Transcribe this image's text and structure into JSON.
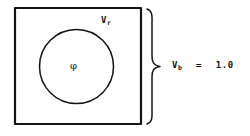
{
  "figure": {
    "background_color": "#ffffff",
    "ink_color": "#141414",
    "shapes": {
      "outer_square": {
        "name": "bulk-volume-square",
        "x": 15,
        "y": 8,
        "width": 126,
        "height": 116,
        "stroke_width": 2.2
      },
      "inner_circle": {
        "name": "reinforcement-volume-circle",
        "cx": 76.5,
        "cy": 66.5,
        "r": 37,
        "stroke_width": 1.5
      },
      "brace": {
        "name": "right-curly-brace",
        "top_y": 8,
        "bottom_y": 124,
        "tip_x": 160,
        "spine_x": 150,
        "stroke_width": 1.5
      }
    },
    "labels": {
      "reinforcement_volume": {
        "base": "V",
        "subscript": "r",
        "full": "Vr"
      },
      "phi": {
        "symbol": "φ"
      },
      "bulk_volume": {
        "base": "V",
        "subscript": "b",
        "equals": "=",
        "value": "1.0",
        "full": "Vb = 1.0"
      }
    }
  }
}
